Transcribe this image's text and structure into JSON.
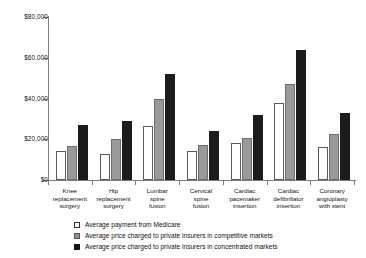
{
  "chart_data": {
    "type": "bar",
    "title": "",
    "subtitle": "",
    "xlabel": "",
    "ylabel": "",
    "ylim": [
      0,
      80000
    ],
    "ytick_labels": [
      "$0",
      "$20,000",
      "$40,000",
      "$60,000",
      "$80,000"
    ],
    "ytick_values": [
      0,
      20000,
      40000,
      60000,
      80000
    ],
    "grid": false,
    "legend_position": "bottom",
    "categories": [
      "Knee replacement surgery",
      "Hip replacement surgery",
      "Lumbar spine fusion",
      "Cervical spine fusion",
      "Cardiac pacemaker insertion",
      "Cardiac defibrillator insertion",
      "Coronary angioplasty with stent"
    ],
    "category_lines": [
      [
        "Knee",
        "replacement",
        "surgery"
      ],
      [
        "Hip",
        "replacement",
        "surgery"
      ],
      [
        "Lumbar",
        "spine",
        "fusion"
      ],
      [
        "Cervical",
        "spine",
        "fusion"
      ],
      [
        "Cardiac",
        "pacemaker",
        "insertion"
      ],
      [
        "Cardiac",
        "defibrillator",
        "insertion"
      ],
      [
        "Coronary",
        "angioplasty",
        "with stent"
      ]
    ],
    "series": [
      {
        "name": "Average payment from Medicare",
        "color": "#ffffff",
        "values": [
          14000,
          13000,
          26500,
          14000,
          18000,
          38000,
          16000
        ]
      },
      {
        "name": "Average price charged to private insurers in competitive markets",
        "color": "#9a9a9a",
        "values": [
          16500,
          20000,
          40000,
          17000,
          20500,
          47000,
          22500
        ]
      },
      {
        "name": "Average price charged to private insurers in concentrated markets",
        "color": "#1c1c1c",
        "values": [
          27000,
          29000,
          52000,
          24000,
          32000,
          64000,
          33000
        ]
      }
    ]
  }
}
